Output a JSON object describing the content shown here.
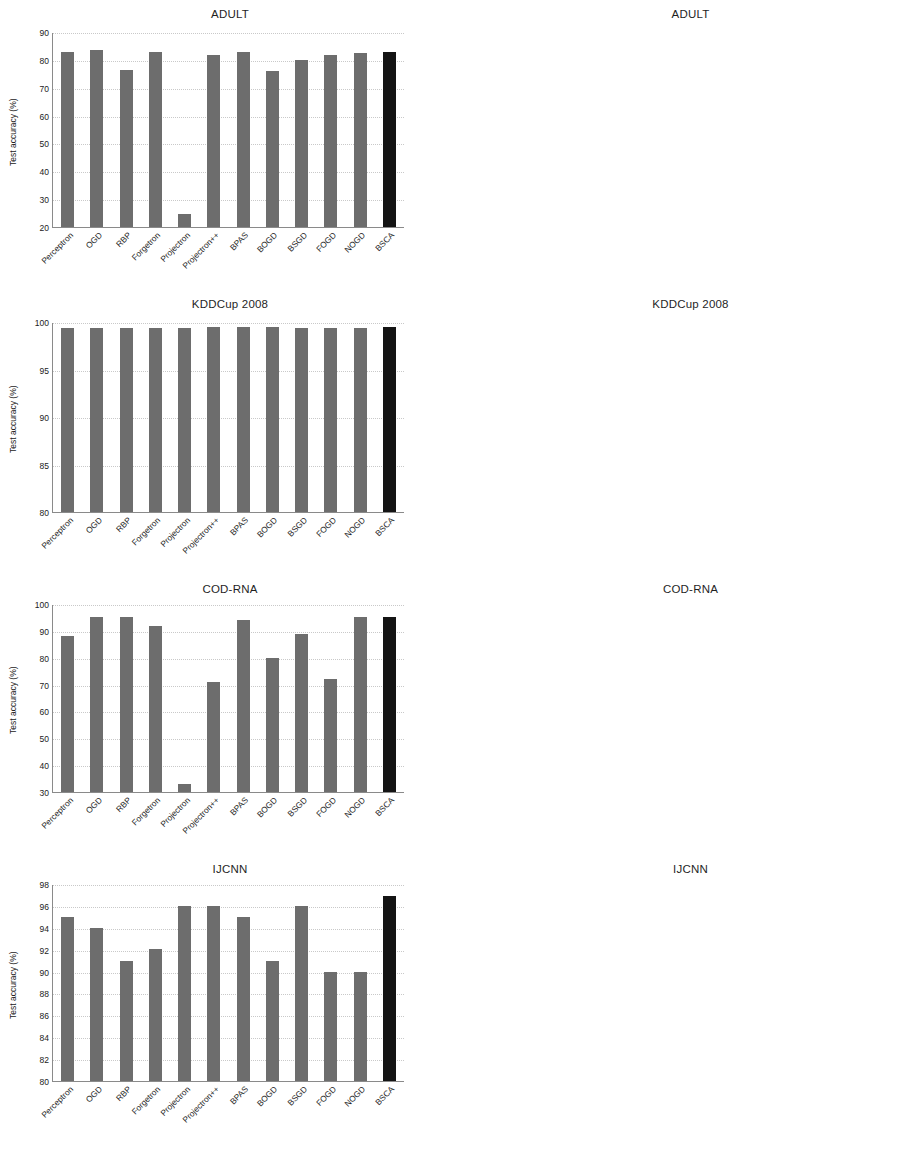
{
  "figure": {
    "categories": [
      "Perceptron",
      "OGD",
      "RBP",
      "Forgetron",
      "Projectron",
      "Projectron++",
      "BPAS",
      "BOGD",
      "BSGD",
      "FOGD",
      "NOGD",
      "BSCA"
    ],
    "highlight_category": "BSCA",
    "accuracy_axis_label": "Test accuracy (%)",
    "time_axis_label": "Training time (sec)",
    "colors": {
      "accuracy_bar": "#6d6d6d",
      "time_bar": "#b6b6b6",
      "highlight_bar": "#141414",
      "gridline": "#c9c9c9",
      "axis": "#8a8a8a"
    }
  },
  "chart_data": [
    {
      "id": "adult-accuracy",
      "type": "bar",
      "title": "ADULT",
      "xlabel": "",
      "ylabel": "Test accuracy (%)",
      "ylim": [
        20,
        90
      ],
      "yticks": [
        20,
        30,
        40,
        50,
        60,
        70,
        80,
        90
      ],
      "grid": true,
      "categories": [
        "Perceptron",
        "OGD",
        "RBP",
        "Forgetron",
        "Projectron",
        "Projectron++",
        "BPAS",
        "BOGD",
        "BSGD",
        "FOGD",
        "NOGD",
        "BSCA"
      ],
      "values": [
        82.9,
        83.5,
        76.3,
        82.9,
        24.6,
        81.9,
        82.9,
        76.0,
        79.8,
        81.7,
        82.5,
        82.7
      ]
    },
    {
      "id": "adult-time",
      "type": "bar",
      "title": "ADULT",
      "xlabel": "",
      "ylabel": "Training time (sec)",
      "ylim": [
        0,
        120
      ],
      "yticks": [
        0,
        20,
        40,
        60,
        80,
        100,
        120
      ],
      "grid": true,
      "categories": [
        "Perceptron",
        "OGD",
        "RBP",
        "Forgetron",
        "Projectron",
        "Projectron++",
        "BPAS",
        "BOGD",
        "BSGD",
        "FOGD",
        "NOGD",
        "BSCA"
      ],
      "values": [
        52.5,
        107.0,
        6.8,
        8.8,
        37.5,
        35.8,
        6.9,
        7.3,
        7.2,
        17.5,
        36.8,
        8.8
      ]
    },
    {
      "id": "kddcup-accuracy",
      "type": "bar",
      "title": "KDDCup 2008",
      "xlabel": "",
      "ylabel": "Test accuracy (%)",
      "ylim": [
        80,
        100
      ],
      "yticks": [
        80,
        85,
        90,
        95,
        100
      ],
      "grid": true,
      "categories": [
        "Perceptron",
        "OGD",
        "RBP",
        "Forgetron",
        "Projectron",
        "Projectron++",
        "BPAS",
        "BOGD",
        "BSGD",
        "FOGD",
        "NOGD",
        "BSCA"
      ],
      "values": [
        99.4,
        99.4,
        99.4,
        99.4,
        99.4,
        99.5,
        99.45,
        99.45,
        99.4,
        99.35,
        99.4,
        99.45
      ]
    },
    {
      "id": "kddcup-time",
      "type": "bar",
      "title": "KDDCup 2008",
      "xlabel": "",
      "ylabel": "Training time (sec)",
      "ylim": [
        0,
        300
      ],
      "yticks": [
        0,
        50,
        100,
        150,
        200,
        250,
        300
      ],
      "grid": true,
      "categories": [
        "Perceptron",
        "OGD",
        "RBP",
        "Forgetron",
        "Projectron",
        "Projectron++",
        "BPAS",
        "BOGD",
        "BSGD",
        "FOGD",
        "NOGD",
        "BSCA"
      ],
      "values": [
        47,
        245,
        48,
        46,
        48,
        59,
        99,
        99,
        19,
        47,
        120,
        17
      ]
    },
    {
      "id": "codrna-accuracy",
      "type": "bar",
      "title": "COD-RNA",
      "xlabel": "",
      "ylabel": "Test accuracy (%)",
      "ylim": [
        30,
        100
      ],
      "yticks": [
        30,
        40,
        50,
        60,
        70,
        80,
        90,
        100
      ],
      "grid": true,
      "categories": [
        "Perceptron",
        "OGD",
        "RBP",
        "Forgetron",
        "Projectron",
        "Projectron++",
        "BPAS",
        "BOGD",
        "BSGD",
        "FOGD",
        "NOGD",
        "BSCA"
      ],
      "values": [
        88.0,
        95.3,
        95.3,
        92.0,
        32.8,
        71.0,
        94.0,
        79.8,
        88.7,
        72.0,
        95.0,
        95.0
      ]
    },
    {
      "id": "codrna-time",
      "type": "bar",
      "title": "COD-RNA",
      "xlabel": "",
      "ylabel": "Training time (sec)",
      "ylim": [
        0,
        80
      ],
      "yticks": [
        0,
        10,
        20,
        30,
        40,
        50,
        60,
        70,
        80
      ],
      "grid": true,
      "categories": [
        "Perceptron",
        "OGD",
        "RBP",
        "Forgetron",
        "Projectron",
        "Projectron++",
        "BPAS",
        "BOGD",
        "BSGD",
        "FOGD",
        "NOGD",
        "BSCA"
      ],
      "values": [
        59.5,
        80.0,
        5.8,
        6.8,
        60.5,
        45.5,
        5.8,
        5.6,
        3.6,
        8.8,
        37.8,
        5.2
      ],
      "annotations": [
        {
          "category": "OGD",
          "text": "227",
          "note": "clipped-bar-value"
        }
      ]
    },
    {
      "id": "ijcnn-accuracy",
      "type": "bar",
      "title": "IJCNN",
      "xlabel": "",
      "ylabel": "Test accuracy (%)",
      "ylim": [
        80,
        98
      ],
      "yticks": [
        80,
        82,
        84,
        86,
        88,
        90,
        92,
        94,
        96,
        98
      ],
      "grid": true,
      "categories": [
        "Perceptron",
        "OGD",
        "RBP",
        "Forgetron",
        "Projectron",
        "Projectron++",
        "BPAS",
        "BOGD",
        "BSGD",
        "FOGD",
        "NOGD",
        "BSCA"
      ],
      "values": [
        95.0,
        94.0,
        91.0,
        92.1,
        96.0,
        96.0,
        95.0,
        91.0,
        96.0,
        90.0,
        90.0,
        96.9
      ]
    },
    {
      "id": "ijcnn-time",
      "type": "bar",
      "title": "IJCNN",
      "xlabel": "",
      "ylabel": "Training time (sec)",
      "ylim": [
        0,
        100
      ],
      "yticks": [
        0,
        10,
        20,
        30,
        40,
        50,
        60,
        70,
        80,
        90,
        100
      ],
      "grid": true,
      "categories": [
        "Perceptron",
        "OGD",
        "RBP",
        "Forgetron",
        "Projectron",
        "Projectron++",
        "BPAS",
        "BOGD",
        "BSGD",
        "FOGD",
        "NOGD",
        "BSCA"
      ],
      "values": [
        24.5,
        92.0,
        7.8,
        8.5,
        10.5,
        50.5,
        7.8,
        7.6,
        10.3,
        25.8,
        39.5,
        10.0
      ]
    }
  ]
}
